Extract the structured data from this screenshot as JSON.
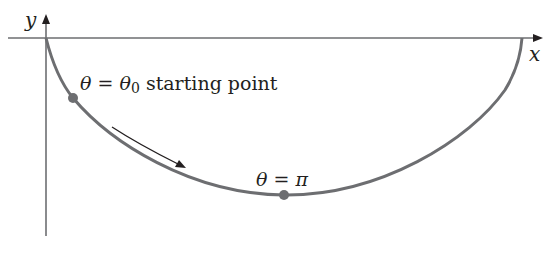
{
  "diagram": {
    "type": "cycloid-path",
    "axes": {
      "x_label": "x",
      "y_label": "y",
      "axis_color": "#6d6e71"
    },
    "curve": {
      "color": "#6d6e71",
      "shape": "inverted cycloid arch"
    },
    "points": [
      {
        "id": "start",
        "label_theta": "θ",
        "label_eq": "=",
        "label_theta0": "θ",
        "label_sub": "0",
        "label_text": "starting point",
        "color": "#6d6e71"
      },
      {
        "id": "bottom",
        "label_theta": "θ",
        "label_eq": "=",
        "label_pi": "π",
        "color": "#6d6e71"
      }
    ],
    "direction_arrow": {
      "meaning": "direction of motion",
      "color": "#231f20"
    }
  }
}
